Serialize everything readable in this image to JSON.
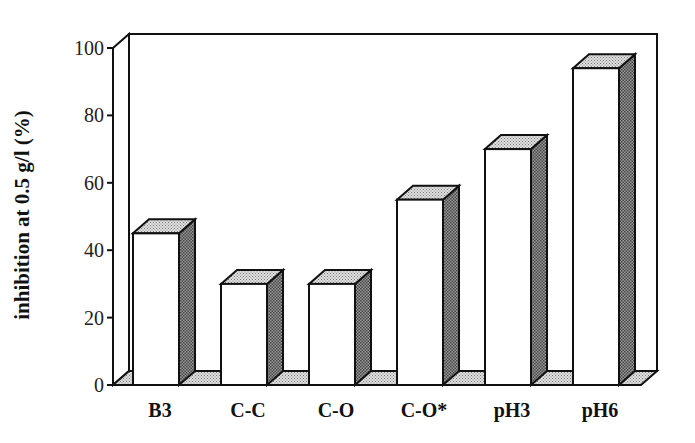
{
  "chart_data": {
    "type": "bar",
    "style": "3d-bar",
    "title": "",
    "xlabel": "",
    "ylabel": "inhibition at 0.5 g/l (%)",
    "categories": [
      "B3",
      "C-C",
      "C-O",
      "C-O*",
      "pH3",
      "pH6"
    ],
    "values": [
      45,
      30,
      30,
      55,
      70,
      94
    ],
    "ylim": [
      0,
      100
    ],
    "yticks": [
      0,
      20,
      40,
      60,
      80,
      100
    ],
    "grid": false,
    "legend": null,
    "colors": {
      "bar_front": "#ffffff",
      "bar_side": "#8a8a8a",
      "bar_top": "#cfcfcf",
      "outline": "#111111"
    }
  }
}
